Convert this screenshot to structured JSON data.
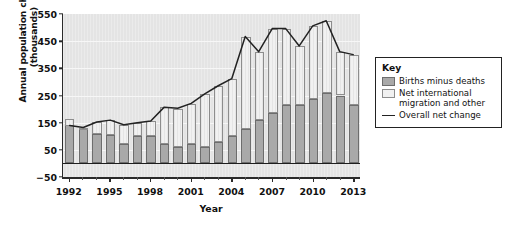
{
  "chart_data": {
    "type": "bar",
    "subtype": "stacked-bar-with-line-overlay",
    "title": "",
    "xlabel": "Year",
    "ylabel": "Annual population change (thousands)",
    "ylabel_lines": [
      "Annual population change",
      "(thousands)"
    ],
    "ylim": [
      -50,
      550
    ],
    "yticks": [
      550,
      450,
      350,
      250,
      150,
      50,
      -50
    ],
    "ytick_labels": [
      "550",
      "450",
      "350",
      "250",
      "150",
      "50",
      "−50"
    ],
    "grid": true,
    "legend_position": "right-outside",
    "categories": [
      "1992",
      "1993",
      "1994",
      "1995",
      "1996",
      "1997",
      "1998",
      "1999",
      "2000",
      "2001",
      "2002",
      "2003",
      "2004",
      "2005",
      "2006",
      "2007",
      "2008",
      "2009",
      "2010",
      "2011",
      "2012",
      "2013"
    ],
    "xtick_labels": [
      "1992",
      "1995",
      "1998",
      "2001",
      "2004",
      "2007",
      "2010",
      "2013"
    ],
    "xtick_categories": [
      "1992",
      "1995",
      "1998",
      "2001",
      "2004",
      "2007",
      "2010",
      "2013"
    ],
    "series": [
      {
        "name": "Births minus deaths",
        "color": "#a9a9a9",
        "type": "bar-segment",
        "values": [
          163,
          128,
          108,
          103,
          73,
          100,
          100,
          73,
          61,
          72,
          61,
          78,
          101,
          127,
          159,
          185,
          216,
          216,
          238,
          258,
          250,
          216
        ]
      },
      {
        "name": "Net international migration and other",
        "color": "#f1f1f1",
        "type": "bar-segment",
        "values": [
          -25,
          3,
          43,
          55,
          68,
          48,
          55,
          133,
          141,
          148,
          194,
          207,
          210,
          340,
          252,
          311,
          280,
          216,
          268,
          267,
          161,
          184
        ]
      },
      {
        "name": "Overall net change",
        "color": "#222222",
        "type": "line",
        "values": [
          138,
          131,
          151,
          158,
          141,
          148,
          155,
          206,
          202,
          220,
          255,
          285,
          311,
          467,
          411,
          496,
          496,
          432,
          506,
          525,
          411,
          400
        ]
      }
    ],
    "legend": {
      "title": "Key",
      "entries": [
        {
          "label": "Births minus deaths",
          "marker": "swatch",
          "color": "#a9a9a9"
        },
        {
          "label": "Net international migration and other",
          "marker": "swatch",
          "color": "#f1f1f1"
        },
        {
          "label": "Overall net change",
          "marker": "line",
          "color": "#222222"
        }
      ]
    }
  },
  "axes": {
    "y_title_line1": "Annual population change",
    "y_title_line2": "(thousands)",
    "x_title": "Year"
  },
  "legend": {
    "title": "Key",
    "item_births": "Births minus deaths",
    "item_migration_line1": "Net international",
    "item_migration_line2": "migration and other",
    "item_overall": "Overall net change"
  },
  "colors": {
    "births_fill": "#a9a9a9",
    "migration_fill": "#f1f1f1",
    "line": "#222222",
    "panel": "#e4e4e4",
    "axis": "#2a2a2a"
  }
}
